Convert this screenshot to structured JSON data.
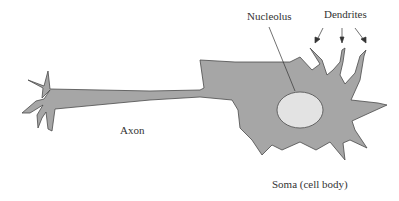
{
  "diagram": {
    "labels": {
      "nucleolus": "Nucleolus",
      "dendrites": "Dendrites",
      "axon": "Axon",
      "soma": "Soma (cell body)"
    },
    "colors": {
      "cell_fill": "#a6a6a6",
      "cell_stroke": "#4a4a4a",
      "nucleolus_fill": "#e3e3e3",
      "text": "#333333"
    }
  }
}
